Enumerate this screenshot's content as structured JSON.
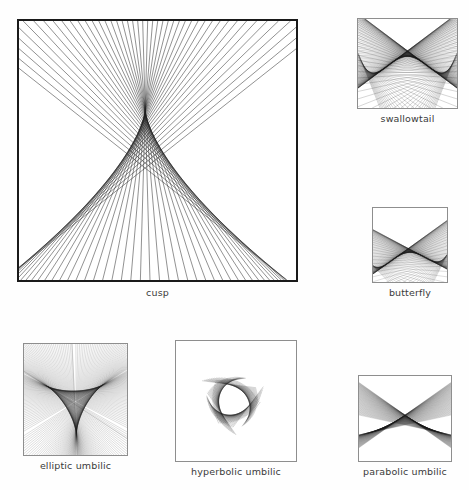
{
  "figure": {
    "background_color": "#fefefe",
    "ink_color": "#1e1e1e",
    "frame_color": "#8e8e8e"
  },
  "panels": [
    {
      "id": "cusp",
      "caption": "cusp",
      "catastrophe": "cusp",
      "corank": 1,
      "codimension": 2,
      "rendering": "straight-line ray family forming a cusp caustic envelope"
    },
    {
      "id": "swallowtail",
      "caption": "swallowtail",
      "catastrophe": "swallowtail",
      "corank": 1,
      "codimension": 3,
      "rendering": "ray family forming a swallowtail caustic with triangular pocket"
    },
    {
      "id": "butterfly",
      "caption": "butterfly",
      "catastrophe": "butterfly",
      "corank": 1,
      "codimension": 4,
      "rendering": "ray family forming a butterfly caustic with central X and wings"
    },
    {
      "id": "elliptic-umbilic",
      "caption": "elliptic umbilic",
      "catastrophe": "elliptic umbilic",
      "corank": 2,
      "codimension": 3,
      "rendering": "three-cusped deltoid caustic with ribbed arms"
    },
    {
      "id": "hyperbolic-umbilic",
      "caption": "hyperbolic umbilic",
      "catastrophe": "hyperbolic umbilic",
      "corank": 2,
      "codimension": 3,
      "rendering": "ribbed lobed caustic sheets"
    },
    {
      "id": "parabolic-umbilic",
      "caption": "parabolic umbilic",
      "catastrophe": "parabolic umbilic",
      "corank": 2,
      "codimension": 4,
      "rendering": "chevron caustic with lateral ray fans"
    }
  ],
  "chart_data": {
    "type": "line",
    "xlabel": "",
    "ylabel": "",
    "grid": false,
    "legend": "none",
    "series": [
      {
        "name": "cusp",
        "label": "cusp",
        "line_count": 46,
        "envelope": "semicubical cusp x^(2/3)"
      },
      {
        "name": "swallowtail",
        "label": "swallowtail",
        "line_count": 120,
        "envelope": "swallowtail self-intersecting curve"
      },
      {
        "name": "butterfly",
        "label": "butterfly",
        "line_count": 110,
        "envelope": "butterfly caustic"
      },
      {
        "name": "elliptic umbilic",
        "label": "elliptic umbilic",
        "line_count": 120,
        "envelope": "deltoid / three-cusped hypocycloid"
      },
      {
        "name": "hyperbolic umbilic",
        "label": "hyperbolic umbilic",
        "line_count": 120,
        "envelope": "hyperbolic umbilic sheets"
      },
      {
        "name": "parabolic umbilic",
        "label": "parabolic umbilic",
        "line_count": 110,
        "envelope": "parabolic umbilic chevron"
      }
    ]
  }
}
